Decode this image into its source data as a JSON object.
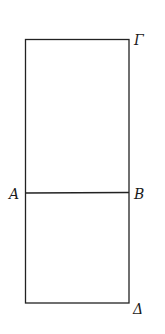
{
  "diagram": {
    "type": "geometric-figure",
    "labels": {
      "top_right": "Γ",
      "left_mid": "A",
      "right_mid": "B",
      "bottom_right": "Δ"
    },
    "geometry": {
      "rect": {
        "x1": 25,
        "y1": 39,
        "x2": 129,
        "y2": 303
      },
      "divider_y": 193
    }
  }
}
